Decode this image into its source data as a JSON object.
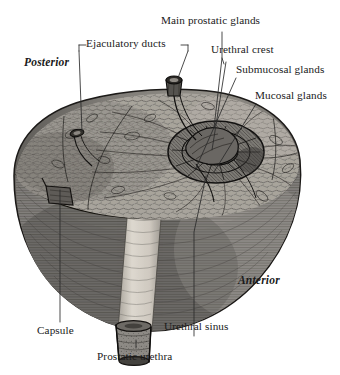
{
  "figure": {
    "kind": "anatomical-illustration",
    "style": "grayscale engraving / stipple hatching",
    "palette": {
      "background": "#ffffff",
      "ink": "#1a1a1a",
      "leader_line": "#2b2b2b",
      "cut_surface_light": "#b9b5ae",
      "cut_surface_mid": "#8d8a84",
      "capsule_shadow": "#6f6d69",
      "body_dark": "#63615e",
      "body_mid": "#7e7b77",
      "body_light": "#a7a39d",
      "urethra_channel": "#cfcac2",
      "urethra_stub": "#8a8782",
      "crest_dark": "#4a4845"
    }
  },
  "labels": {
    "main_prostatic_glands": "Main prostatic glands",
    "ejaculatory_ducts": "Ejaculatory ducts",
    "urethral_crest": "Urethral crest",
    "submucosal_glands": "Submucosal glands",
    "mucosal_glands": "Mucosal glands",
    "posterior": "Posterior",
    "anterior": "Anterior",
    "capsule": "Capsule",
    "urethral_sinus": "Urethral sinus",
    "prostatic_urethra": "Prostatic urethra"
  }
}
